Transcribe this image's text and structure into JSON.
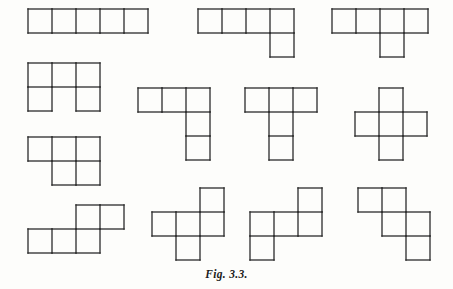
{
  "figure": {
    "caption": "Fig. 3.3.",
    "caption_x": 0,
    "caption_y": 268,
    "background_color": "#fdfdfb",
    "line_color": "#2b2b2b",
    "line_width": 1.3,
    "cell_size": 24,
    "width": 453,
    "height": 289
  },
  "chart_data": {
    "type": "diagram",
    "title": "Fig. 3.3.",
    "subtitle": "",
    "cell_size": 24,
    "shape_count": 12,
    "shapes": [
      {
        "name": "I-pentomino",
        "origin_x": 28,
        "origin_y": 9,
        "cols": 5,
        "rows": 1,
        "cells": [
          [
            0,
            0
          ],
          [
            1,
            0
          ],
          [
            2,
            0
          ],
          [
            3,
            0
          ],
          [
            4,
            0
          ]
        ]
      },
      {
        "name": "L-pentomino",
        "origin_x": 198,
        "origin_y": 9,
        "cols": 4,
        "rows": 2,
        "cells": [
          [
            0,
            0
          ],
          [
            1,
            0
          ],
          [
            2,
            0
          ],
          [
            3,
            0
          ],
          [
            3,
            1
          ]
        ]
      },
      {
        "name": "Y-pentomino",
        "origin_x": 332,
        "origin_y": 9,
        "cols": 4,
        "rows": 2,
        "cells": [
          [
            0,
            0
          ],
          [
            1,
            0
          ],
          [
            2,
            0
          ],
          [
            3,
            0
          ],
          [
            2,
            1
          ]
        ]
      },
      {
        "name": "U-pentomino",
        "origin_x": 28,
        "origin_y": 63,
        "cols": 3,
        "rows": 2,
        "cells": [
          [
            0,
            0
          ],
          [
            1,
            0
          ],
          [
            2,
            0
          ],
          [
            0,
            1
          ],
          [
            2,
            1
          ]
        ]
      },
      {
        "name": "V-pentomino",
        "origin_x": 138,
        "origin_y": 88,
        "cols": 3,
        "rows": 3,
        "cells": [
          [
            0,
            0
          ],
          [
            1,
            0
          ],
          [
            2,
            0
          ],
          [
            2,
            1
          ],
          [
            2,
            2
          ]
        ]
      },
      {
        "name": "T-pentomino",
        "origin_x": 245,
        "origin_y": 88,
        "cols": 3,
        "rows": 3,
        "cells": [
          [
            0,
            0
          ],
          [
            1,
            0
          ],
          [
            2,
            0
          ],
          [
            1,
            1
          ],
          [
            1,
            2
          ]
        ]
      },
      {
        "name": "X-pentomino",
        "origin_x": 355,
        "origin_y": 88,
        "cols": 3,
        "rows": 3,
        "cells": [
          [
            1,
            0
          ],
          [
            0,
            1
          ],
          [
            1,
            1
          ],
          [
            2,
            1
          ],
          [
            1,
            2
          ]
        ]
      },
      {
        "name": "P-pentomino",
        "origin_x": 28,
        "origin_y": 137,
        "cols": 3,
        "rows": 2,
        "cells": [
          [
            0,
            0
          ],
          [
            1,
            0
          ],
          [
            2,
            0
          ],
          [
            1,
            1
          ],
          [
            2,
            1
          ]
        ]
      },
      {
        "name": "N-pentomino",
        "origin_x": 28,
        "origin_y": 205,
        "cols": 4,
        "rows": 2,
        "cells": [
          [
            2,
            0
          ],
          [
            3,
            0
          ],
          [
            0,
            1
          ],
          [
            1,
            1
          ],
          [
            2,
            1
          ]
        ]
      },
      {
        "name": "F-pentomino",
        "origin_x": 152,
        "origin_y": 188,
        "cols": 3,
        "rows": 3,
        "cells": [
          [
            2,
            0
          ],
          [
            0,
            1
          ],
          [
            1,
            1
          ],
          [
            2,
            1
          ],
          [
            1,
            2
          ]
        ]
      },
      {
        "name": "S-pentomino",
        "origin_x": 250,
        "origin_y": 188,
        "cols": 3,
        "rows": 3,
        "cells": [
          [
            2,
            0
          ],
          [
            0,
            1
          ],
          [
            1,
            1
          ],
          [
            2,
            1
          ],
          [
            0,
            2
          ]
        ]
      },
      {
        "name": "W-pentomino",
        "origin_x": 358,
        "origin_y": 188,
        "cols": 3,
        "rows": 3,
        "cells": [
          [
            0,
            0
          ],
          [
            1,
            0
          ],
          [
            1,
            1
          ],
          [
            2,
            1
          ],
          [
            2,
            2
          ]
        ]
      }
    ]
  }
}
